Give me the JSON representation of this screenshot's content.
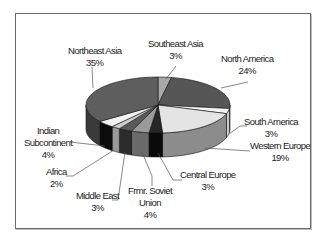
{
  "chart_data": {
    "type": "pie",
    "style": "3d-exploded-none",
    "title": "",
    "slices": [
      {
        "label": "Southeast Asia",
        "value": 3,
        "pct_label": "3%",
        "top": "#a8a8a8",
        "side": "#8a8a8a"
      },
      {
        "label": "North America",
        "value": 24,
        "pct_label": "24%",
        "top": "#565656",
        "side": "#404040"
      },
      {
        "label": "South America",
        "value": 3,
        "pct_label": "3%",
        "top": "#f4f4f4",
        "side": "#cfcfcf"
      },
      {
        "label": "Western Europe",
        "value": 19,
        "pct_label": "19%",
        "top": "#e4e4e4",
        "side": "#8c8c8c"
      },
      {
        "label": "Central Europe",
        "value": 3,
        "pct_label": "3%",
        "top": "#262626",
        "side": "#0a0a0a"
      },
      {
        "label": "Frmr. Soviet Union",
        "value": 4,
        "pct_label": "4%",
        "top": "#9a9a9a",
        "side": "#6a6a6a"
      },
      {
        "label": "Middle East",
        "value": 3,
        "pct_label": "3%",
        "top": "#5a5a5a",
        "side": "#2c2c2c"
      },
      {
        "label": "Africa",
        "value": 2,
        "pct_label": "2%",
        "top": "#cccccc",
        "side": "#999999"
      },
      {
        "label": "Indian Subcontinent",
        "value": 4,
        "pct_label": "4%",
        "top": "#f2f2f2",
        "side": "#0c0c0c"
      },
      {
        "label": "Northeast Asia",
        "value": 35,
        "pct_label": "35%",
        "top": "#5e5e5e",
        "side": "#3a3a3a"
      }
    ],
    "legend": "none (data labels with leader lines)"
  },
  "labels": {
    "southeast_asia": {
      "name": "Southeast Asia",
      "pct": "3%"
    },
    "north_america": {
      "name": "North America",
      "pct": "24%"
    },
    "south_america": {
      "name": "South America",
      "pct": "3%"
    },
    "western_europe": {
      "name": "Western Europe",
      "pct": "19%"
    },
    "central_europe": {
      "name": "Central Europe",
      "pct": "3%"
    },
    "fmr_soviet": {
      "name1": "Frmr. Soviet",
      "name2": "Union",
      "pct": "4%"
    },
    "middle_east": {
      "name": "Middle East",
      "pct": "3%"
    },
    "africa": {
      "name": "Africa",
      "pct": "2%"
    },
    "indian_sub": {
      "name1": "Indian",
      "name2": "Subcontinent",
      "pct": "4%"
    },
    "northeast_asia": {
      "name": "Northeast Asia",
      "pct": "35%"
    }
  }
}
